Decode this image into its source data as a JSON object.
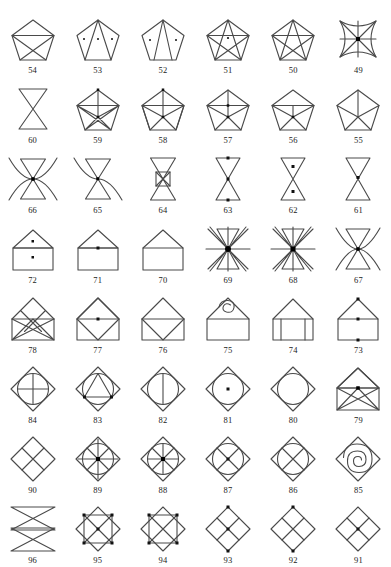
{
  "page": {
    "background_color": "#ffffff",
    "stroke_color": "#4a4a4a",
    "dot_color": "#111111",
    "columns": 6,
    "rows": 8,
    "total_figures": 48,
    "number_range": "49-96"
  },
  "figures": [
    {
      "number": "54",
      "shape": "pentagon-with-crossed-lower-diagonals",
      "row": 1,
      "col": 1,
      "dots": 0
    },
    {
      "number": "53",
      "shape": "pentagon-with-two-apex-rays",
      "row": 1,
      "col": 2,
      "dots": 3
    },
    {
      "number": "52",
      "shape": "pentagon-with-two-apex-rays-narrow",
      "row": 1,
      "col": 3,
      "dots": 2
    },
    {
      "number": "51",
      "shape": "pentagram-in-pentagon",
      "row": 1,
      "col": 4,
      "dots": 1
    },
    {
      "number": "50",
      "shape": "pentagram-in-pentagon-open",
      "row": 1,
      "col": 5,
      "dots": 0
    },
    {
      "number": "49",
      "shape": "concave-square-star-with-diagonals",
      "row": 1,
      "col": 6,
      "dots": 1
    },
    {
      "number": "60",
      "shape": "bowtie-hourglass",
      "row": 2,
      "col": 1,
      "dots": 0
    },
    {
      "number": "59",
      "shape": "pentagon-full-web",
      "row": 2,
      "col": 2,
      "dots": 2
    },
    {
      "number": "58",
      "shape": "pentagon-vertical-axis-web",
      "row": 2,
      "col": 3,
      "dots": 2
    },
    {
      "number": "57",
      "shape": "pentagon-fan-with-chord",
      "row": 2,
      "col": 4,
      "dots": 2
    },
    {
      "number": "56",
      "shape": "pentagon-fan-chord-single",
      "row": 2,
      "col": 5,
      "dots": 1
    },
    {
      "number": "55",
      "shape": "pentagon-fan-from-center",
      "row": 2,
      "col": 6,
      "dots": 0
    },
    {
      "number": "66",
      "shape": "bowtie-with-four-arcs",
      "row": 3,
      "col": 1,
      "dots": 1
    },
    {
      "number": "65",
      "shape": "bowtie-with-two-arcs",
      "row": 3,
      "col": 2,
      "dots": 1
    },
    {
      "number": "64",
      "shape": "bowtie-with-center-box-cross",
      "row": 3,
      "col": 3,
      "dots": 0
    },
    {
      "number": "63",
      "shape": "bowtie-three-dots",
      "row": 3,
      "col": 4,
      "dots": 3
    },
    {
      "number": "62",
      "shape": "bowtie-two-dots",
      "row": 3,
      "col": 5,
      "dots": 2
    },
    {
      "number": "61",
      "shape": "bowtie-center-dot",
      "row": 3,
      "col": 6,
      "dots": 1
    },
    {
      "number": "72",
      "shape": "house-two-dots",
      "row": 4,
      "col": 1,
      "dots": 2
    },
    {
      "number": "71",
      "shape": "house-one-dot",
      "row": 4,
      "col": 2,
      "dots": 1
    },
    {
      "number": "70",
      "shape": "house-plain",
      "row": 4,
      "col": 3,
      "dots": 0
    },
    {
      "number": "69",
      "shape": "bowtie-starburst-large-hub",
      "row": 4,
      "col": 4,
      "dots": 1
    },
    {
      "number": "68",
      "shape": "bowtie-starburst",
      "row": 4,
      "col": 5,
      "dots": 1
    },
    {
      "number": "67",
      "shape": "bowtie-with-side-arcs",
      "row": 4,
      "col": 6,
      "dots": 1
    },
    {
      "number": "78",
      "shape": "envelope-full-diagonals",
      "row": 5,
      "col": 1,
      "dots": 0
    },
    {
      "number": "77",
      "shape": "envelope-diamond-flap",
      "row": 5,
      "col": 2,
      "dots": 1
    },
    {
      "number": "76",
      "shape": "envelope-flap",
      "row": 5,
      "col": 3,
      "dots": 0
    },
    {
      "number": "75",
      "shape": "envelope-with-spiral",
      "row": 5,
      "col": 4,
      "dots": 0
    },
    {
      "number": "74",
      "shape": "house-with-two-vertical-bars",
      "row": 5,
      "col": 5,
      "dots": 0
    },
    {
      "number": "73",
      "shape": "house-three-dots",
      "row": 5,
      "col": 6,
      "dots": 3
    },
    {
      "number": "84",
      "shape": "circle-in-diamond-with-cross",
      "row": 6,
      "col": 1,
      "dots": 0
    },
    {
      "number": "83",
      "shape": "circle-in-diamond-with-triangle",
      "row": 6,
      "col": 2,
      "dots": 2
    },
    {
      "number": "82",
      "shape": "circle-in-diamond-vertical-line",
      "row": 6,
      "col": 3,
      "dots": 0
    },
    {
      "number": "81",
      "shape": "circle-in-diamond-center-dot",
      "row": 6,
      "col": 4,
      "dots": 1
    },
    {
      "number": "80",
      "shape": "circle-in-diamond-plain",
      "row": 6,
      "col": 5,
      "dots": 0
    },
    {
      "number": "79",
      "shape": "envelope-diagonal-rays",
      "row": 6,
      "col": 6,
      "dots": 1
    },
    {
      "number": "90",
      "shape": "diamond-quartered",
      "row": 7,
      "col": 1,
      "dots": 0
    },
    {
      "number": "89",
      "shape": "circle-diamond-eight-spokes",
      "row": 7,
      "col": 2,
      "dots": 1
    },
    {
      "number": "88",
      "shape": "circle-diamond-eight-spokes-alt",
      "row": 7,
      "col": 3,
      "dots": 1
    },
    {
      "number": "87",
      "shape": "circle-diamond-x-cross",
      "row": 7,
      "col": 4,
      "dots": 1
    },
    {
      "number": "86",
      "shape": "circle-diamond-x-only",
      "row": 7,
      "col": 5,
      "dots": 0
    },
    {
      "number": "85",
      "shape": "diamond-with-spiral",
      "row": 7,
      "col": 6,
      "dots": 0
    },
    {
      "number": "96",
      "shape": "stacked-double-bowtie-tall",
      "row": 8,
      "col": 1,
      "dots": 0
    },
    {
      "number": "95",
      "shape": "diamond-square-x-inscribed",
      "row": 8,
      "col": 2,
      "dots": 5
    },
    {
      "number": "94",
      "shape": "diamond-square-x-inscribed-alt",
      "row": 8,
      "col": 3,
      "dots": 4
    },
    {
      "number": "93",
      "shape": "diamond-quartered-dots",
      "row": 8,
      "col": 4,
      "dots": 3
    },
    {
      "number": "92",
      "shape": "diamond-quartered-vertical-dots",
      "row": 8,
      "col": 5,
      "dots": 2
    },
    {
      "number": "91",
      "shape": "diamond-quartered-center-dot",
      "row": 8,
      "col": 6,
      "dots": 1
    }
  ]
}
